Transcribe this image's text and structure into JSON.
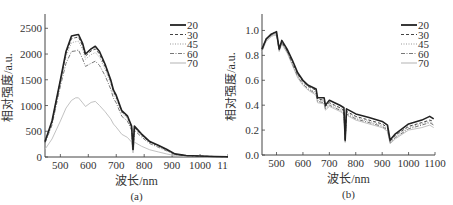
{
  "chart_data": [
    {
      "id": "a",
      "type": "line",
      "caption": "(a)",
      "xlabel": "波长/nm",
      "ylabel": "相对强度/a.u.",
      "xlim": [
        445,
        1100
      ],
      "ylim": [
        0,
        2700
      ],
      "xticks": [
        500,
        600,
        700,
        800,
        900,
        1000,
        1100
      ],
      "xtick_labels": [
        "500",
        "600",
        "700",
        "800",
        "900",
        "1000",
        "1100"
      ],
      "yticks": [
        0,
        500,
        1000,
        1500,
        2000,
        2500
      ],
      "ytick_labels": [
        "0",
        "500",
        "1000",
        "1500",
        "2000",
        "2500"
      ],
      "grid": false,
      "legend_position": "upper right",
      "x": [
        445,
        470,
        500,
        520,
        540,
        555,
        565,
        580,
        590,
        610,
        625,
        640,
        660,
        680,
        690,
        700,
        720,
        740,
        755,
        760,
        765,
        790,
        820,
        850,
        880,
        910,
        950,
        1000,
        1050,
        1100
      ],
      "series": [
        {
          "name": "20",
          "style": "solid-thick",
          "color": "#222222",
          "values": [
            300,
            700,
            1500,
            2050,
            2350,
            2370,
            2380,
            2200,
            2000,
            2100,
            2150,
            2050,
            1800,
            1500,
            1300,
            1200,
            900,
            800,
            600,
            150,
            600,
            450,
            300,
            230,
            150,
            60,
            30,
            20,
            10,
            5
          ]
        },
        {
          "name": "30",
          "style": "dashed",
          "color": "#444444",
          "values": [
            290,
            680,
            1480,
            2010,
            2300,
            2320,
            2330,
            2150,
            1960,
            2060,
            2100,
            2000,
            1760,
            1470,
            1270,
            1170,
            880,
            780,
            580,
            140,
            580,
            430,
            290,
            220,
            140,
            55,
            28,
            18,
            9,
            4
          ]
        },
        {
          "name": "45",
          "style": "dotted",
          "color": "#999999",
          "values": [
            280,
            660,
            1450,
            1950,
            2220,
            2240,
            2250,
            2080,
            1900,
            1990,
            2030,
            1940,
            1700,
            1420,
            1230,
            1130,
            850,
            750,
            560,
            130,
            560,
            420,
            280,
            210,
            130,
            50,
            25,
            16,
            8,
            4
          ]
        },
        {
          "name": "60",
          "style": "dash-dot",
          "color": "#777777",
          "values": [
            270,
            620,
            1380,
            1820,
            2050,
            2060,
            2080,
            1900,
            1760,
            1820,
            1860,
            1780,
            1580,
            1320,
            1140,
            1050,
            790,
            700,
            520,
            120,
            520,
            390,
            260,
            190,
            120,
            45,
            22,
            14,
            7,
            3
          ]
        },
        {
          "name": "70",
          "style": "solid-thin",
          "color": "#bbbbbb",
          "values": [
            150,
            350,
            700,
            950,
            1100,
            1150,
            1150,
            1050,
            980,
            1060,
            1080,
            1000,
            880,
            740,
            640,
            580,
            440,
            380,
            290,
            80,
            290,
            210,
            140,
            100,
            60,
            25,
            12,
            8,
            4,
            2
          ]
        }
      ]
    },
    {
      "id": "b",
      "type": "line",
      "caption": "(b)",
      "xlabel": "波长/nm",
      "ylabel": "相对强度/a.u.",
      "xlim": [
        445,
        1100
      ],
      "ylim": [
        0,
        1.1
      ],
      "xticks": [
        500,
        600,
        700,
        800,
        900,
        1000,
        1100
      ],
      "xtick_labels": [
        "500",
        "600",
        "700",
        "800",
        "900",
        "1000",
        "1100"
      ],
      "yticks": [
        0.0,
        0.2,
        0.4,
        0.6,
        0.8,
        1.0
      ],
      "ytick_labels": [
        "0.0",
        "0.2",
        "0.4",
        "0.6",
        "0.8",
        "1.0"
      ],
      "grid": false,
      "legend_position": "upper right",
      "x": [
        445,
        460,
        480,
        490,
        500,
        510,
        520,
        540,
        560,
        580,
        600,
        620,
        650,
        655,
        680,
        685,
        700,
        720,
        740,
        755,
        760,
        765,
        800,
        850,
        900,
        920,
        930,
        950,
        1000,
        1050,
        1080,
        1095
      ],
      "series": [
        {
          "name": "20",
          "style": "solid-thick",
          "color": "#222222",
          "values": [
            0.85,
            0.93,
            0.97,
            0.98,
            0.99,
            0.85,
            0.92,
            0.85,
            0.76,
            0.66,
            0.6,
            0.56,
            0.53,
            0.46,
            0.46,
            0.4,
            0.44,
            0.42,
            0.4,
            0.38,
            0.12,
            0.37,
            0.33,
            0.3,
            0.27,
            0.24,
            0.12,
            0.17,
            0.25,
            0.28,
            0.31,
            0.29
          ]
        },
        {
          "name": "30",
          "style": "dashed",
          "color": "#444444",
          "values": [
            0.85,
            0.93,
            0.97,
            0.98,
            0.98,
            0.85,
            0.91,
            0.84,
            0.75,
            0.65,
            0.59,
            0.55,
            0.52,
            0.45,
            0.44,
            0.39,
            0.42,
            0.4,
            0.38,
            0.36,
            0.12,
            0.35,
            0.31,
            0.28,
            0.25,
            0.22,
            0.11,
            0.16,
            0.23,
            0.26,
            0.28,
            0.27
          ]
        },
        {
          "name": "45",
          "style": "dotted",
          "color": "#999999",
          "values": [
            0.84,
            0.92,
            0.96,
            0.97,
            0.97,
            0.84,
            0.9,
            0.83,
            0.74,
            0.64,
            0.58,
            0.54,
            0.5,
            0.44,
            0.43,
            0.38,
            0.41,
            0.39,
            0.37,
            0.35,
            0.11,
            0.34,
            0.3,
            0.27,
            0.24,
            0.21,
            0.1,
            0.15,
            0.22,
            0.25,
            0.27,
            0.25
          ]
        },
        {
          "name": "60",
          "style": "dash-dot",
          "color": "#777777",
          "values": [
            0.84,
            0.92,
            0.96,
            0.97,
            0.97,
            0.84,
            0.9,
            0.83,
            0.73,
            0.63,
            0.57,
            0.53,
            0.49,
            0.43,
            0.42,
            0.37,
            0.4,
            0.38,
            0.36,
            0.34,
            0.11,
            0.33,
            0.29,
            0.26,
            0.23,
            0.2,
            0.1,
            0.14,
            0.21,
            0.24,
            0.26,
            0.24
          ]
        },
        {
          "name": "70",
          "style": "solid-thin",
          "color": "#bbbbbb",
          "values": [
            0.83,
            0.91,
            0.95,
            0.96,
            0.96,
            0.83,
            0.89,
            0.82,
            0.72,
            0.62,
            0.56,
            0.52,
            0.48,
            0.42,
            0.41,
            0.36,
            0.39,
            0.37,
            0.35,
            0.33,
            0.1,
            0.32,
            0.28,
            0.25,
            0.22,
            0.19,
            0.09,
            0.13,
            0.2,
            0.22,
            0.24,
            0.22
          ]
        }
      ]
    }
  ],
  "panels": [
    {
      "caption": "(a)",
      "xlabel": "波长/nm",
      "ylabel": "相对强度/a.u.",
      "legend": [
        "20",
        "30",
        "45",
        "60",
        "70"
      ]
    },
    {
      "caption": "(b)",
      "xlabel": "波长/nm",
      "ylabel": "相对强度/a.u.",
      "legend": [
        "20",
        "30",
        "45",
        "60",
        "70"
      ]
    }
  ]
}
